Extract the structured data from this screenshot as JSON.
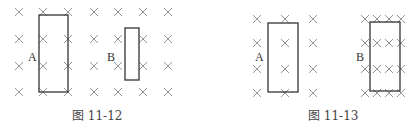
{
  "figures": [
    {
      "caption": "图 11-12",
      "field_symbol": "×",
      "field_columns_x": [
        19,
        43,
        68,
        94,
        118,
        143,
        168
      ],
      "field_rows_y": [
        12,
        39,
        66,
        92
      ],
      "loops": [
        {
          "label": "A",
          "rect": {
            "x1": 39,
            "y1": 15,
            "x2": 68,
            "y2": 92
          },
          "label_pos": {
            "x": 28,
            "y": 51
          }
        },
        {
          "label": "B",
          "rect": {
            "x1": 125,
            "y1": 28,
            "x2": 139,
            "y2": 80
          },
          "label_pos": {
            "x": 107,
            "y": 51
          }
        }
      ],
      "caption_pos": {
        "x": 72,
        "y": 110
      }
    },
    {
      "caption": "图 11-13",
      "field_symbol": "×",
      "field_groups": [
        {
          "columns_x": [
            257,
            285,
            313
          ],
          "rows_y": [
            19,
            43,
            69,
            93
          ]
        },
        {
          "columns_x": [
            365,
            377,
            389,
            401
          ],
          "rows_y": [
            19,
            43,
            69,
            93
          ]
        }
      ],
      "loops": [
        {
          "label": "A",
          "rect": {
            "x1": 268,
            "y1": 23,
            "x2": 298,
            "y2": 92
          },
          "label_pos": {
            "x": 255,
            "y": 51
          }
        },
        {
          "label": "B",
          "rect": {
            "x1": 370,
            "y1": 22,
            "x2": 400,
            "y2": 91
          },
          "label_pos": {
            "x": 356,
            "y": 51
          }
        }
      ],
      "caption_pos": {
        "x": 308,
        "y": 110
      }
    }
  ],
  "colors": {
    "cross": "#8a8a8a",
    "loop": "#333333",
    "text": "#333333"
  }
}
